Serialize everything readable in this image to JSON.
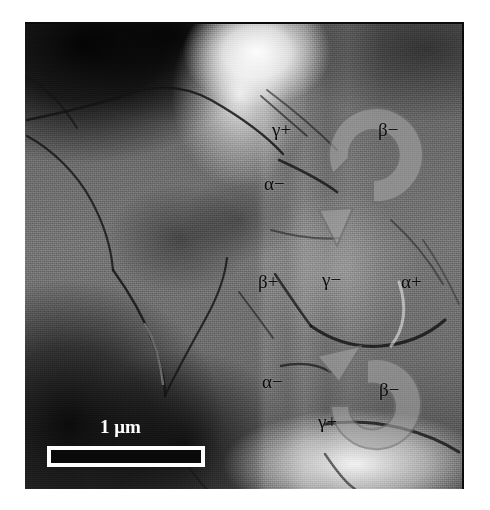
{
  "figure": {
    "kind": "electron-micrograph",
    "background_color": "#ffffff",
    "image_frame": {
      "x": 25,
      "y": 22,
      "width": 437,
      "height": 465,
      "border_color": "#0a0a0a"
    }
  },
  "scale_bar": {
    "label": "1 μm",
    "label_color": "#ffffff",
    "bar_fill": "#0a0a0a",
    "bar_outline": "#ffffff",
    "bar_x": 47,
    "bar_y": 444,
    "bar_width": 158,
    "bar_height": 20,
    "label_x": 100,
    "label_y": 415
  },
  "arrows": [
    {
      "id": "upper-rotation-arrow",
      "sense": "clockwise",
      "center_x": 335,
      "center_y": 168,
      "radius": 44,
      "stroke_color": "#8e8e8e",
      "fill_color": "#9a9a9a",
      "opacity": 0.62
    },
    {
      "id": "lower-rotation-arrow",
      "sense": "counterclockwise",
      "center_x": 330,
      "center_y": 362,
      "radius": 42,
      "stroke_color": "#8e8e8e",
      "fill_color": "#9a9a9a",
      "opacity": 0.62
    }
  ],
  "annotations": [
    {
      "id": "label-gamma-plus-top",
      "text": "γ+",
      "x": 272,
      "y": 118,
      "group": "upper-arrow"
    },
    {
      "id": "label-beta-minus-top",
      "text": "β−",
      "x": 378,
      "y": 118,
      "group": "upper-arrow"
    },
    {
      "id": "label-alpha-minus-top",
      "text": "α−",
      "x": 264,
      "y": 172,
      "group": "upper-arrow"
    },
    {
      "id": "label-beta-plus-mid",
      "text": "β+",
      "x": 258,
      "y": 270,
      "group": "centre"
    },
    {
      "id": "label-gamma-minus-mid",
      "text": "γ−",
      "x": 322,
      "y": 268,
      "group": "centre"
    },
    {
      "id": "label-alpha-plus-mid",
      "text": "α+",
      "x": 401,
      "y": 270,
      "group": "centre"
    },
    {
      "id": "label-alpha-minus-bot",
      "text": "α−",
      "x": 262,
      "y": 370,
      "group": "lower-arrow"
    },
    {
      "id": "label-beta-minus-bot",
      "text": "β−",
      "x": 379,
      "y": 378,
      "group": "lower-arrow"
    },
    {
      "id": "label-gamma-plus-bot",
      "text": "γ+",
      "x": 318,
      "y": 410,
      "group": "lower-arrow"
    }
  ],
  "tone_map": {
    "darkest": "#0a0a0a",
    "dark": "#3a3a3a",
    "mid": "#6d6d6d",
    "light": "#b4b4b4",
    "brightest": "#ffffff"
  }
}
